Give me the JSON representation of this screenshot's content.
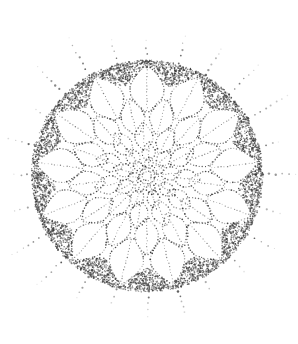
{
  "image": {
    "title": "Stippled radial rosette illustration",
    "subject": "succulent-rosette-with-radiating-rays",
    "technique": "stipple / pointillist dot drawing",
    "background_color": "#ffffff",
    "dot_color_dark": "#3a3a3a",
    "dot_color_mid": "#5c5c5c",
    "dot_color_light": "#8d8d8d",
    "canvas": {
      "width": 298,
      "height": 344
    }
  },
  "geometry": {
    "center": {
      "x": 147,
      "y": 176
    },
    "body_radius": 113,
    "dark_rim_inner_radius": 92,
    "dark_rim_outer_radius": 113,
    "ray_count": 24,
    "ray_inner_radius": 113,
    "ray_outer_radius": 158,
    "ray_dot_spacing": 6.5,
    "ray_angle_offset_deg": -90
  },
  "whorls": [
    {
      "name": "outer-whorl",
      "petal_count": 13,
      "inner_radius": 62,
      "outer_radius": 112,
      "phase_deg": 0,
      "tip_sharpness": 0.52
    },
    {
      "name": "second-whorl",
      "petal_count": 13,
      "inner_radius": 40,
      "outer_radius": 80,
      "phase_deg": 14,
      "tip_sharpness": 0.56
    },
    {
      "name": "third-whorl",
      "petal_count": 11,
      "inner_radius": 24,
      "outer_radius": 54,
      "phase_deg": 28,
      "tip_sharpness": 0.6
    },
    {
      "name": "fourth-whorl",
      "petal_count": 9,
      "inner_radius": 13,
      "outer_radius": 34,
      "phase_deg": 44,
      "tip_sharpness": 0.62
    },
    {
      "name": "inner-whorl",
      "petal_count": 7,
      "inner_radius": 5,
      "outer_radius": 20,
      "phase_deg": 60,
      "tip_sharpness": 0.66
    },
    {
      "name": "core-bud",
      "petal_count": 4,
      "inner_radius": 2,
      "outer_radius": 10,
      "phase_deg": 76,
      "tip_sharpness": 0.7
    }
  ],
  "rim_arcs": {
    "segment_count": 13,
    "description": "dark stippled scalloped wedges filling the gaps between outer petal tips and the body circle"
  },
  "labels": {
    "caption": ""
  }
}
